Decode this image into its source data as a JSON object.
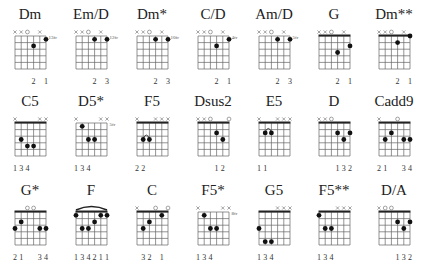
{
  "diagram_type": "guitar chord chart",
  "colors": {
    "ink": "#222222",
    "grid": "#555555",
    "muted": "#666666"
  },
  "chords": [
    {
      "name": "Dm",
      "top": [
        "x",
        "x",
        "o",
        "",
        "x",
        ""
      ],
      "nut": false,
      "fret_label": "13fr",
      "dots": [
        [
          3,
          2
        ],
        [
          5,
          1
        ]
      ],
      "barre": null,
      "arc": null,
      "fingers": [
        "",
        "",
        "",
        "2",
        "",
        "1"
      ]
    },
    {
      "name": "Em/D",
      "top": [
        "x",
        "x",
        "o",
        "",
        "x",
        ""
      ],
      "nut": false,
      "fret_label": "12fr",
      "dots": [
        [
          3,
          1
        ],
        [
          5,
          1
        ]
      ],
      "barre": null,
      "arc": null,
      "fingers": [
        "",
        "",
        "",
        "2",
        "",
        "3"
      ]
    },
    {
      "name": "Dm*",
      "top": [
        "x",
        "x",
        "o",
        "",
        "x",
        ""
      ],
      "nut": false,
      "fret_label": "10fr",
      "dots": [
        [
          3,
          1
        ],
        [
          5,
          1
        ]
      ],
      "barre": null,
      "arc": null,
      "fingers": [
        "",
        "",
        "",
        "2",
        "",
        "3"
      ]
    },
    {
      "name": "C/D",
      "top": [
        "x",
        "x",
        "o",
        "",
        "x",
        ""
      ],
      "nut": false,
      "fret_label": "4fr",
      "dots": [
        [
          3,
          2
        ],
        [
          5,
          1
        ]
      ],
      "barre": null,
      "arc": null,
      "fingers": [
        "",
        "",
        "",
        "2",
        "",
        "1"
      ]
    },
    {
      "name": "Am/D",
      "top": [
        "x",
        "x",
        "o",
        "",
        "x",
        ""
      ],
      "nut": false,
      "fret_label": "5fr",
      "dots": [
        [
          3,
          1
        ],
        [
          5,
          1
        ]
      ],
      "barre": null,
      "arc": null,
      "fingers": [
        "",
        "",
        "",
        "2",
        "",
        "3"
      ]
    },
    {
      "name": "G",
      "top": [
        "x",
        "x",
        "o",
        "",
        "x",
        ""
      ],
      "nut": true,
      "fret_label": "",
      "dots": [
        [
          3,
          3
        ],
        [
          5,
          2
        ]
      ],
      "barre": null,
      "arc": null,
      "fingers": [
        "",
        "",
        "",
        "2",
        "",
        "1"
      ]
    },
    {
      "name": "Dm**",
      "top": [
        "x",
        "x",
        "o",
        "",
        "x",
        ""
      ],
      "nut": true,
      "fret_label": "",
      "dots": [
        [
          3,
          1.5
        ],
        [
          5,
          0.5
        ]
      ],
      "barre": null,
      "arc": null,
      "fingers": [
        "",
        "",
        "",
        "2",
        "",
        "1"
      ]
    },
    {
      "name": "C5",
      "top": [
        "x",
        "",
        "",
        "",
        "x",
        "x"
      ],
      "nut": true,
      "fret_label": "",
      "dots": [
        [
          1,
          3
        ],
        [
          2,
          4
        ],
        [
          3,
          4
        ]
      ],
      "barre": null,
      "arc": null,
      "fingers": [
        "1",
        "3",
        "4",
        "",
        "",
        ""
      ]
    },
    {
      "name": "D5*",
      "top": [
        "x",
        "",
        "",
        "",
        "x",
        "x"
      ],
      "nut": false,
      "fret_label": "5fr",
      "dots": [
        [
          1,
          1
        ],
        [
          2,
          3
        ],
        [
          3,
          3
        ]
      ],
      "barre": null,
      "arc": null,
      "fingers": [
        "1",
        "3",
        "4",
        "",
        "",
        ""
      ]
    },
    {
      "name": "F5",
      "top": [
        "x",
        "",
        "",
        "x",
        "x",
        "x"
      ],
      "nut": true,
      "fret_label": "",
      "dots": [
        [
          1,
          3
        ],
        [
          2,
          3
        ]
      ],
      "barre": null,
      "arc": [
        1,
        2,
        3
      ],
      "fingers": [
        "2",
        "2",
        "",
        "",
        "",
        ""
      ]
    },
    {
      "name": "Dsus2",
      "top": [
        "x",
        "x",
        "o",
        "",
        "",
        "o"
      ],
      "nut": true,
      "fret_label": "",
      "dots": [
        [
          3,
          2
        ],
        [
          4,
          3
        ]
      ],
      "barre": null,
      "arc": null,
      "fingers": [
        "",
        "",
        "",
        "1",
        "2",
        ""
      ]
    },
    {
      "name": "E5",
      "top": [
        "x",
        "",
        "",
        "x",
        "x",
        "x"
      ],
      "nut": true,
      "fret_label": "",
      "dots": [
        [
          1,
          2
        ],
        [
          2,
          2
        ]
      ],
      "barre": null,
      "arc": [
        1,
        2,
        2
      ],
      "fingers": [
        "1",
        "1",
        "",
        "",
        "",
        ""
      ]
    },
    {
      "name": "D",
      "top": [
        "x",
        "x",
        "o",
        "",
        "",
        ""
      ],
      "nut": true,
      "fret_label": "",
      "dots": [
        [
          3,
          2
        ],
        [
          4,
          3
        ],
        [
          5,
          2
        ]
      ],
      "barre": null,
      "arc": null,
      "fingers": [
        "",
        "",
        "",
        "1",
        "3",
        "2"
      ]
    },
    {
      "name": "Cadd9",
      "top": [
        "x",
        "",
        "",
        "o",
        "",
        ""
      ],
      "nut": true,
      "fret_label": "",
      "dots": [
        [
          1,
          3
        ],
        [
          2,
          2
        ],
        [
          4,
          3
        ],
        [
          5,
          3
        ]
      ],
      "barre": null,
      "arc": null,
      "fingers": [
        "2",
        "1",
        "",
        "",
        "3",
        "4"
      ]
    },
    {
      "name": "G*",
      "top": [
        "",
        "",
        "o",
        "o",
        "",
        ""
      ],
      "nut": true,
      "fret_label": "",
      "dots": [
        [
          0,
          3
        ],
        [
          1,
          2
        ],
        [
          4,
          3
        ],
        [
          5,
          3
        ]
      ],
      "barre": null,
      "arc": null,
      "fingers": [
        "2",
        "1",
        "",
        "",
        "3",
        "4"
      ]
    },
    {
      "name": "F",
      "top": [
        "",
        "",
        "",
        "",
        "",
        ""
      ],
      "nut": true,
      "fret_label": "",
      "dots": [
        [
          0,
          1
        ],
        [
          1,
          3
        ],
        [
          2,
          3
        ],
        [
          3,
          2
        ],
        [
          4,
          1
        ],
        [
          5,
          1
        ]
      ],
      "barre": [
        0,
        5,
        1
      ],
      "arc": null,
      "fingers": [
        "1",
        "3",
        "4",
        "2",
        "1",
        "1"
      ]
    },
    {
      "name": "C",
      "top": [
        "x",
        "",
        "",
        "o",
        "",
        "o"
      ],
      "nut": true,
      "fret_label": "",
      "dots": [
        [
          1,
          3
        ],
        [
          2,
          2
        ],
        [
          4,
          1
        ]
      ],
      "barre": null,
      "arc": null,
      "fingers": [
        "",
        "3",
        "2",
        "",
        "1",
        ""
      ]
    },
    {
      "name": "F5*",
      "top": [
        "x",
        "",
        "",
        "",
        "x",
        "x"
      ],
      "nut": false,
      "fret_label": "8fr",
      "dots": [
        [
          1,
          1
        ],
        [
          2,
          3
        ],
        [
          3,
          3
        ]
      ],
      "barre": null,
      "arc": null,
      "fingers": [
        "1",
        "3",
        "4",
        "",
        "",
        ""
      ]
    },
    {
      "name": "G5",
      "top": [
        "",
        "",
        "",
        "x",
        "x",
        "x"
      ],
      "nut": true,
      "fret_label": "",
      "dots": [
        [
          0,
          3
        ],
        [
          1,
          5
        ],
        [
          2,
          5
        ]
      ],
      "barre": null,
      "arc": null,
      "fingers": [
        "1",
        "3",
        "4",
        "",
        "",
        ""
      ]
    },
    {
      "name": "F5**",
      "top": [
        "",
        "",
        "",
        "x",
        "x",
        "x"
      ],
      "nut": true,
      "fret_label": "",
      "dots": [
        [
          0,
          1
        ],
        [
          1,
          3
        ],
        [
          2,
          3
        ]
      ],
      "barre": null,
      "arc": null,
      "fingers": [
        "1",
        "3",
        "4",
        "",
        "",
        ""
      ]
    },
    {
      "name": "D/A",
      "top": [
        "x",
        "o",
        "o",
        "",
        "",
        ""
      ],
      "nut": true,
      "fret_label": "",
      "dots": [
        [
          3,
          2
        ],
        [
          4,
          3
        ],
        [
          5,
          2
        ]
      ],
      "barre": null,
      "arc": null,
      "fingers": [
        "",
        "",
        "",
        "1",
        "3",
        "2"
      ]
    }
  ]
}
